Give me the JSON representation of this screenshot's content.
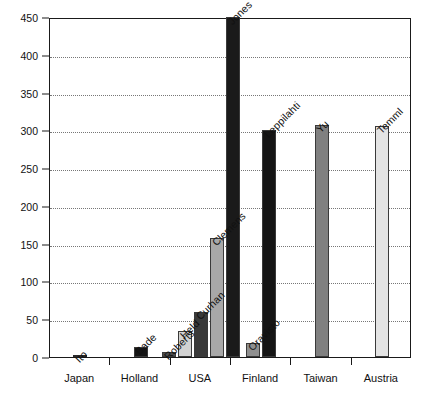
{
  "chart_data": {
    "type": "bar",
    "title": "",
    "subtitle": "",
    "xlabel": "",
    "ylabel": "",
    "ylim": [
      0,
      450
    ],
    "ytick_step": 50,
    "yticks": [
      0,
      50,
      100,
      150,
      200,
      250,
      300,
      350,
      400,
      450
    ],
    "ytick_labels": [
      "0",
      "50",
      "100",
      "150",
      "200",
      "250",
      "300",
      "350",
      "400",
      "450"
    ],
    "grid": true,
    "grid_axis": "y",
    "grid_style": "dotted",
    "legend": "none",
    "categories": [
      "Japan",
      "Holland",
      "USA",
      "Finland",
      "Taiwan",
      "Austria"
    ],
    "bars": [
      {
        "group": "Japan",
        "label": "Ito",
        "value": 3,
        "color": "#ffffff"
      },
      {
        "group": "Holland",
        "label": "Bade",
        "value": 13,
        "color": "#151515"
      },
      {
        "group": "USA",
        "label": "Roberts",
        "value": 7,
        "color": "#4d4d4d"
      },
      {
        "group": "USA",
        "label": "Held",
        "value": 35,
        "color": "#d2d2d2"
      },
      {
        "group": "USA",
        "label": "Curhan",
        "value": 60,
        "color": "#3a3a3a"
      },
      {
        "group": "USA",
        "label": "Clemens",
        "value": 158,
        "color": "#a8a8a8"
      },
      {
        "group": "USA",
        "label": "Jones",
        "value": 450,
        "color": "#1a1a1a"
      },
      {
        "group": "Finland",
        "label": "Oravisto",
        "value": 18,
        "color": "#8f8f8f"
      },
      {
        "group": "Finland",
        "label": "Leppilahti",
        "value": 300,
        "color": "#151515"
      },
      {
        "group": "Taiwan",
        "label": "Yu",
        "value": 307,
        "color": "#808080"
      },
      {
        "group": "Austria",
        "label": "Temml",
        "value": 306,
        "color": "#e4e4e4"
      }
    ]
  },
  "axes": {
    "y_tick_labels": [
      "450",
      "400",
      "350",
      "300",
      "250",
      "200",
      "150",
      "100",
      "50",
      "0"
    ],
    "x_group_labels": [
      "Japan",
      "Holland",
      "USA",
      "Finland",
      "Taiwan",
      "Austria"
    ]
  },
  "series_labels": {
    "ito": "Ito",
    "bade": "Bade",
    "roberts": "Roberts",
    "held": "Held",
    "curhan": "Curhan",
    "clemens": "Clemens",
    "jones": "Jones",
    "oravisto": "Oravisto",
    "leppilahti": "Leppilahti",
    "yu": "Yu",
    "temml": "Temml"
  },
  "colors": {
    "axis": "#1a1a1a",
    "grid": "#777777",
    "background": "#ffffff",
    "text": "#111111"
  }
}
